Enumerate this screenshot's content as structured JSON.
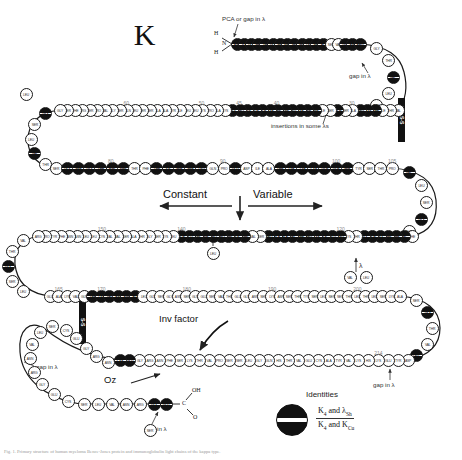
{
  "figure": {
    "chain_title": "K",
    "domain_labels": {
      "constant": "Constant",
      "variable": "Variable"
    },
    "annotations": {
      "pca_gap": "PCA or gap in λ",
      "gap_in_lambda_top": "gap in λ",
      "insertions": "insertions in some  λs",
      "inv_factor": "Inv factor",
      "oz": "Oz",
      "gap_in_lambda_left": "gap in λ",
      "gap_in_lambda_bottom": "gap in λ",
      "gap_in_lambda_right": "gap in λ",
      "lambda_marker": "λ"
    },
    "termini": {
      "n_terminus_h_top": "H",
      "n_terminus_n": "N",
      "n_terminus_h_bottom": "H",
      "c_terminus_oh": "OH",
      "c_terminus_c": "C",
      "c_terminus_o": "O"
    },
    "disulfide_label": "S-S",
    "legend": {
      "title": "Identities",
      "numerator_a": "K",
      "numerator_a_sub": "4",
      "numerator_and": "and",
      "numerator_b": "λ",
      "numerator_b_sub": "Sh",
      "denominator_a": "K",
      "denominator_a_sub": "4",
      "denominator_and": "and",
      "denominator_b": "K",
      "denominator_b_sub": "Cu"
    },
    "caption": "Fig. 1. Primary structure of human myeloma Bence-Jones protein and immunoglobulin light chains of the kappa type.",
    "numbering": [
      "20",
      "30",
      "40",
      "45",
      "50",
      "60",
      "70",
      "80",
      "90",
      "100",
      "105",
      "110",
      "120",
      "140",
      "150",
      "160",
      "165",
      "170",
      "180",
      "190",
      "200",
      "210",
      "214"
    ],
    "colors": {
      "identity_fill": "#111111",
      "bead_outline": "#1a1a1a",
      "bead_fill": "#ffffff",
      "number_label": "#8a8a8a",
      "annotation": "#222222"
    }
  },
  "chart_data": {
    "type": "diagram",
    "title": "K",
    "rows": [
      {
        "id": "row1",
        "direction": "left-to-right",
        "residues": [
          "ASP",
          "ILE",
          "GLN",
          "MET",
          "THR",
          "GLN",
          "SER",
          "PRO",
          "SER",
          "SER",
          "LEU",
          "SER",
          "ALA",
          "SER",
          "VAL",
          "GLY",
          "ASP",
          "ARG"
        ],
        "identity": [
          true,
          true,
          true,
          true,
          true,
          true,
          true,
          true,
          true,
          true,
          true,
          true,
          true,
          false,
          false,
          true,
          true,
          true
        ]
      },
      {
        "id": "row2",
        "direction": "right-to-left",
        "residues": [
          "VAL",
          "THR",
          "ILE",
          "THR",
          "CYS",
          "ARG",
          "ALA",
          "SER",
          "GLN",
          "SER",
          "ILE",
          "SER",
          "SER",
          "TYR",
          "LEU",
          "ASN",
          "TRP",
          "TYR",
          "GLN",
          "GLN",
          "LYS",
          "PRO",
          "GLY",
          "LYS",
          "ALA",
          "PRO",
          "LYS",
          "LEU",
          "LEU",
          "ILE",
          "TYR",
          "ALA",
          "ALA",
          "SER",
          "SER",
          "LEU",
          "GLN",
          "SER",
          "GLY",
          "VAL",
          "PRO",
          "SER",
          "ARG",
          "PHE",
          "SER",
          "GLY"
        ],
        "identity": [
          false,
          false,
          false,
          true,
          true,
          true,
          false,
          false,
          true,
          false,
          false,
          true,
          true,
          true,
          true,
          true,
          true,
          true,
          true,
          true,
          true,
          true,
          true,
          false,
          false,
          false,
          false,
          false,
          false,
          false,
          false,
          false,
          false,
          false,
          false,
          false,
          false,
          false,
          false,
          false,
          false,
          false,
          false,
          false,
          false,
          false
        ]
      },
      {
        "id": "row3",
        "direction": "left-to-right",
        "residues": [
          "SER",
          "GLY",
          "SER",
          "GLY",
          "THR",
          "ASP",
          "PHE",
          "THR",
          "PHE",
          "THR",
          "ILE",
          "SER",
          "SER",
          "LEU",
          "GLN",
          "PRO",
          "GLU",
          "ASP",
          "ILE",
          "ALA",
          "THR",
          "TYR",
          "TYR",
          "CYS",
          "GLN",
          "GLN",
          "SER",
          "TYR",
          "SER",
          "THR",
          "PRO"
        ],
        "identity": [
          false,
          true,
          true,
          true,
          true,
          true,
          true,
          false,
          false,
          true,
          true,
          true,
          true,
          true,
          false,
          false,
          true,
          false,
          false,
          false,
          true,
          true,
          true,
          true,
          true,
          true,
          true,
          false,
          false,
          false,
          false
        ]
      },
      {
        "id": "row4",
        "direction": "right-to-left",
        "residues": [
          "PHE",
          "VAL",
          "THR",
          "PHE",
          "GLY",
          "GLN",
          "GLY",
          "THR",
          "LYS",
          "LEU",
          "GLU",
          "ILE",
          "LYS",
          "ARG",
          "THR",
          "VAL",
          "ALA",
          "ALA",
          "PRO",
          "SER",
          "VAL",
          "PHE",
          "ILE",
          "PHE",
          "PRO",
          "PRO",
          "SER",
          "ASP",
          "GLU",
          "GLN",
          "LEU",
          "LYS",
          "SER",
          "GLY",
          "THR",
          "ALA",
          "SER",
          "VAL",
          "VAL",
          "CYS",
          "LEU",
          "LEU",
          "ASN",
          "ASN",
          "PHE",
          "TYR",
          "PRO",
          "ARG"
        ],
        "identity": [
          false,
          true,
          true,
          true,
          true,
          true,
          true,
          false,
          false,
          true,
          true,
          true,
          true,
          true,
          true,
          true,
          true,
          true,
          true,
          false,
          false,
          true,
          true,
          true,
          true,
          true,
          true,
          true,
          true,
          true,
          false,
          false,
          false,
          false,
          false,
          false,
          false,
          false,
          false,
          false,
          false,
          false,
          false,
          false,
          false,
          false,
          false,
          false
        ]
      },
      {
        "id": "row5",
        "direction": "left-to-right",
        "residues": [
          "GLU",
          "ALA",
          "LYS",
          "VAL",
          "GLN",
          "TRP",
          "LYS",
          "VAL",
          "ASP",
          "ASN",
          "ALA",
          "LEU",
          "GLN",
          "SER",
          "GLY",
          "ASN",
          "SER",
          "GLN",
          "GLU",
          "SER",
          "VAL",
          "THR",
          "GLU",
          "GLN",
          "ASP",
          "SER",
          "LYS",
          "ASP",
          "SER",
          "THR",
          "TYR",
          "SER",
          "LEU",
          "SER",
          "SER",
          "THR",
          "LEU",
          "THR",
          "LEU",
          "SER",
          "LYS",
          "ALA"
        ],
        "identity": [
          false,
          false,
          false,
          false,
          false,
          true,
          true,
          true,
          true,
          true,
          true,
          false,
          false,
          false,
          false,
          false,
          false,
          false,
          false,
          false,
          false,
          false,
          false,
          false,
          false,
          false,
          false,
          false,
          false,
          false,
          false,
          false,
          false,
          false,
          false,
          false,
          false,
          false,
          false,
          false,
          false,
          false
        ]
      },
      {
        "id": "row6",
        "direction": "right-to-left",
        "residues": [
          "ASP",
          "TYR",
          "GLU",
          "LYS",
          "HIS",
          "LYS",
          "VAL",
          "TYR",
          "ALA",
          "CYS",
          "GLU",
          "VAL",
          "THR",
          "HIS",
          "GLN",
          "GLY",
          "LEU",
          "SER",
          "SER",
          "PRO",
          "VAL",
          "THR",
          "LYS",
          "SER",
          "PHE",
          "ASN",
          "ARG",
          "GLY",
          "GLU",
          "CYS"
        ],
        "identity": [
          false,
          false,
          false,
          false,
          false,
          false,
          false,
          false,
          false,
          false,
          false,
          false,
          false,
          false,
          false,
          false,
          false,
          false,
          false,
          false,
          false,
          false,
          false,
          false,
          false,
          false,
          false,
          false,
          true,
          true
        ]
      }
    ],
    "disulfide_bonds": [
      {
        "label": "S-S",
        "location": "variable-domain-right"
      },
      {
        "label": "S-S",
        "location": "constant-domain-left"
      }
    ],
    "annotations_on_chart": [
      {
        "text": "PCA or gap in λ",
        "target": "residue 1"
      },
      {
        "text": "gap in λ",
        "target": "near residue 27"
      },
      {
        "text": "insertions in some  λs",
        "target": "CDR region"
      },
      {
        "text": "Constant",
        "target": "C-domain direction"
      },
      {
        "text": "Variable",
        "target": "V-domain direction"
      },
      {
        "text": "Inv factor",
        "target": "residue 191"
      },
      {
        "text": "Oz",
        "target": "lambda marker"
      },
      {
        "text": "gap in λ",
        "target": "residue 200 loop"
      },
      {
        "text": "gap in λ",
        "target": "C-terminal 214"
      },
      {
        "text": "gap in λ",
        "target": "residue 170 area"
      }
    ],
    "legend": {
      "symbol": "half-filled circle",
      "meaning": "Identities: K4 and λSh over K4 and KCu"
    }
  }
}
